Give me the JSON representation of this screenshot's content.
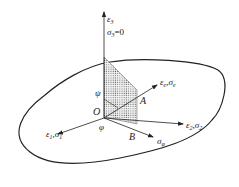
{
  "diagram": {
    "type": "stress-strain coordinate diagram",
    "axes": {
      "axis3": {
        "symbol": "ε",
        "sub": "3",
        "stress_label": "σ",
        "stress_sub": "3",
        "stress_value": "=0"
      },
      "axis1": {
        "eps": "ε",
        "eps_sub": "1",
        "sep": ",",
        "sig": "σ",
        "sig_sub": "1"
      },
      "axis2": {
        "eps": "ε",
        "eps_sub": "2",
        "sep": ",",
        "sig": "σ",
        "sig_sub": "2"
      },
      "axis_e": {
        "eps": "ε",
        "eps_sub": "e",
        "sep": ",",
        "sig": "σ",
        "sig_sub": "e"
      },
      "axis_phi": {
        "sig": "σ",
        "sig_sub": "φ"
      }
    },
    "points": {
      "origin": "O",
      "a": "A",
      "b": "B"
    },
    "angles": {
      "psi": "ψ",
      "phi": "φ"
    },
    "colors": {
      "line": "#222222",
      "fill_dots": "#555555",
      "background": "#ffffff"
    }
  }
}
